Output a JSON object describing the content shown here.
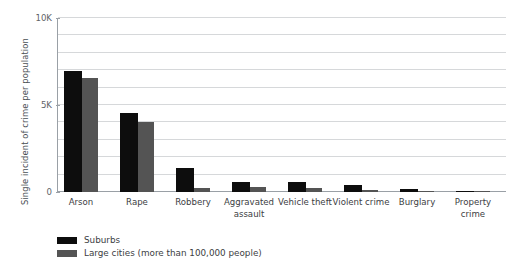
{
  "chart_data": {
    "type": "bar",
    "title": "",
    "xlabel": "",
    "ylabel": "Single incident of crime per population",
    "ylim": [
      0,
      10000
    ],
    "ytick_labels": [
      "0",
      "5K",
      "10K"
    ],
    "ytick_values": [
      0,
      5000,
      10000
    ],
    "grid": true,
    "grid_step": 1000,
    "legend_position": "bottom-left",
    "categories": [
      "Arson",
      "Rape",
      "Robbery",
      "Aggravated assault",
      "Vehicle theft",
      "Violent crime",
      "Burglary",
      "Property crime"
    ],
    "series": [
      {
        "name": "Suburbs",
        "color": "#0d0d0d",
        "values": [
          6950,
          4550,
          1380,
          570,
          570,
          400,
          170,
          40
        ]
      },
      {
        "name": "Large cities (more than 100,000 people)",
        "color": "#545454",
        "values": [
          6550,
          4000,
          230,
          290,
          230,
          120,
          60,
          25
        ]
      }
    ]
  },
  "axis": {
    "y_title": "Single incident of crime per population"
  },
  "legend": {
    "items": [
      {
        "label": "Suburbs",
        "color": "#0d0d0d"
      },
      {
        "label": "Large cities (more than 100,000 people)",
        "color": "#545454"
      }
    ]
  },
  "colors": {
    "background": "#ffffff",
    "gridline": "#d6d8da",
    "axis": "#9aa0a6",
    "text": "#3c4043",
    "suburbs": "#0d0d0d",
    "large_cities": "#545454"
  }
}
